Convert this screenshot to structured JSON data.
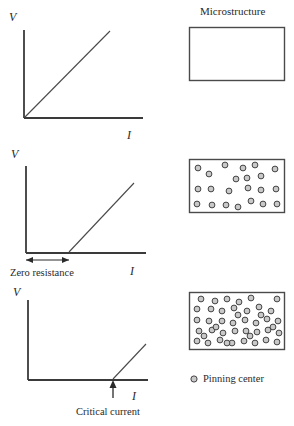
{
  "figure": {
    "title_right": "Microstructure",
    "legend": {
      "marker": "pinning-center-circle",
      "label": "Pinning center"
    }
  },
  "panels": [
    {
      "id": "panel-top",
      "y_axis_label": "V",
      "x_axis_label": "I",
      "caption": "",
      "curve_type": "ohmic-linear-through-origin",
      "microstructure": {
        "label": "Microstructure",
        "circle_count": 0,
        "circles": []
      }
    },
    {
      "id": "panel-middle",
      "y_axis_label": "V",
      "x_axis_label": "I",
      "caption": "Zero resistance",
      "curve_type": "zero-then-linear",
      "microstructure": {
        "label": "",
        "circle_count": 22,
        "circles": [
          [
            9,
            9
          ],
          [
            20,
            15
          ],
          [
            36,
            6
          ],
          [
            54,
            9
          ],
          [
            66,
            6
          ],
          [
            47,
            20
          ],
          [
            58,
            19
          ],
          [
            72,
            17
          ],
          [
            86,
            10
          ],
          [
            9,
            30
          ],
          [
            22,
            30
          ],
          [
            40,
            32
          ],
          [
            59,
            29
          ],
          [
            72,
            31
          ],
          [
            87,
            30
          ],
          [
            8,
            45
          ],
          [
            23,
            46
          ],
          [
            37,
            46
          ],
          [
            49,
            48
          ],
          [
            62,
            42
          ],
          [
            74,
            45
          ],
          [
            88,
            45
          ]
        ]
      }
    },
    {
      "id": "panel-bottom",
      "y_axis_label": "V",
      "x_axis_label": "I",
      "caption": "Critical current",
      "curve_type": "flat-then-kink-linear",
      "microstructure": {
        "label": "",
        "circle_count": 44,
        "circles": [
          [
            12,
            6
          ],
          [
            26,
            8
          ],
          [
            38,
            6
          ],
          [
            50,
            9
          ],
          [
            62,
            5
          ],
          [
            88,
            6
          ],
          [
            8,
            16
          ],
          [
            22,
            16
          ],
          [
            33,
            18
          ],
          [
            45,
            15
          ],
          [
            58,
            18
          ],
          [
            70,
            14
          ],
          [
            82,
            18
          ],
          [
            8,
            27
          ],
          [
            20,
            28
          ],
          [
            33,
            28
          ],
          [
            44,
            30
          ],
          [
            56,
            27
          ],
          [
            67,
            30
          ],
          [
            78,
            26
          ],
          [
            89,
            28
          ],
          [
            10,
            38
          ],
          [
            23,
            37
          ],
          [
            34,
            40
          ],
          [
            46,
            38
          ],
          [
            57,
            38
          ],
          [
            68,
            39
          ],
          [
            79,
            37
          ],
          [
            90,
            40
          ],
          [
            8,
            48
          ],
          [
            19,
            50
          ],
          [
            31,
            47
          ],
          [
            43,
            50
          ],
          [
            55,
            48
          ],
          [
            66,
            50
          ],
          [
            77,
            47
          ],
          [
            88,
            49
          ],
          [
            15,
            43
          ],
          [
            27,
            34
          ],
          [
            49,
            22
          ],
          [
            61,
            43
          ],
          [
            72,
            22
          ],
          [
            84,
            34
          ],
          [
            38,
            50
          ]
        ]
      }
    }
  ],
  "colors": {
    "stroke": "#3a3a3a",
    "circle_fill": "#c9c9c9",
    "circle_stroke": "#333333",
    "background": "#ffffff",
    "text": "#2a2a2a"
  }
}
